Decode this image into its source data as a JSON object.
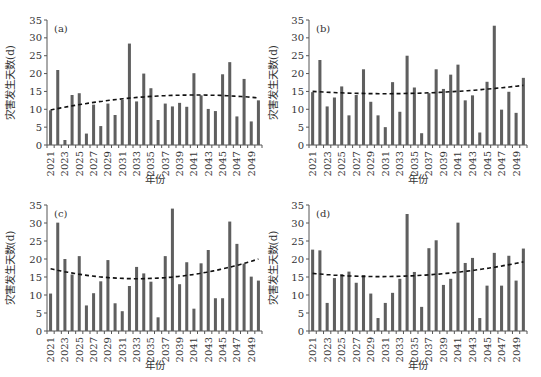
{
  "chart_data": [
    {
      "type": "bar",
      "panel_label": "(a)",
      "xlabel": "年份",
      "ylabel": "灾害发生天数(d)",
      "ylim": [
        0,
        35
      ],
      "yticks": [
        0,
        5,
        10,
        15,
        20,
        25,
        30,
        35
      ],
      "xtick_labels": [
        "2021",
        "2023",
        "2025",
        "2027",
        "2029",
        "2031",
        "2033",
        "2035",
        "2037",
        "2039",
        "2041",
        "2043",
        "2045",
        "2047",
        "2049"
      ],
      "categories": [
        2021,
        2022,
        2023,
        2024,
        2025,
        2026,
        2027,
        2028,
        2029,
        2030,
        2031,
        2032,
        2033,
        2034,
        2035,
        2036,
        2037,
        2038,
        2039,
        2040,
        2041,
        2042,
        2043,
        2044,
        2045,
        2046,
        2047,
        2048,
        2049,
        2050
      ],
      "values": [
        9.7,
        21,
        1.4,
        14,
        14.5,
        3.2,
        11.3,
        5.3,
        11.6,
        8.4,
        12.6,
        28.4,
        12.2,
        20,
        15.9,
        7,
        11.6,
        10.8,
        11.8,
        10.7,
        20.1,
        13.9,
        10.1,
        9.5,
        19.8,
        23.2,
        8,
        18.5,
        6.6,
        12.5
      ],
      "trend": {
        "type": "polynomial",
        "style": "dashed",
        "start": 9.8,
        "extreme": 14.0,
        "extreme_year": 2041,
        "end": 13.2
      },
      "grid": false
    },
    {
      "type": "bar",
      "panel_label": "(b)",
      "xlabel": "年份",
      "ylabel": "灾害发生天数(d)",
      "ylim": [
        0,
        35
      ],
      "yticks": [
        0,
        5,
        10,
        15,
        20,
        25,
        30,
        35
      ],
      "xtick_labels": [
        "2021",
        "2023",
        "2025",
        "2027",
        "2029",
        "2031",
        "2033",
        "2035",
        "2037",
        "2039",
        "2041",
        "2043",
        "2045",
        "2047",
        "2049"
      ],
      "categories": [
        2021,
        2022,
        2023,
        2024,
        2025,
        2026,
        2027,
        2028,
        2029,
        2030,
        2031,
        2032,
        2033,
        2034,
        2035,
        2036,
        2037,
        2038,
        2039,
        2040,
        2041,
        2042,
        2043,
        2044,
        2045,
        2046,
        2047,
        2048,
        2049,
        2050
      ],
      "values": [
        14.8,
        23.8,
        10.8,
        13.3,
        16.4,
        8.3,
        14,
        21.2,
        12.1,
        8.3,
        5,
        17.6,
        9.3,
        25,
        16.1,
        3.3,
        14.5,
        21.2,
        15.7,
        19.7,
        22.5,
        12.5,
        13.9,
        3.5,
        17.7,
        33.4,
        9.9,
        14.9,
        9,
        18.8
      ],
      "trend": {
        "type": "polynomial",
        "style": "dashed",
        "start": 15.0,
        "extreme": 14.4,
        "extreme_year": 2033,
        "end": 16.7
      },
      "grid": false
    },
    {
      "type": "bar",
      "panel_label": "(c)",
      "xlabel": "年份",
      "ylabel": "灾害发生天数(d)",
      "ylim": [
        0,
        35
      ],
      "yticks": [
        0,
        5,
        10,
        15,
        20,
        25,
        30,
        35
      ],
      "xtick_labels": [
        "2021",
        "2023",
        "2025",
        "2027",
        "2029",
        "2031",
        "2033",
        "2035",
        "2037",
        "2039",
        "2041",
        "2043",
        "2045",
        "2047",
        "2049"
      ],
      "categories": [
        2021,
        2022,
        2023,
        2024,
        2025,
        2026,
        2027,
        2028,
        2029,
        2030,
        2031,
        2032,
        2033,
        2034,
        2035,
        2036,
        2037,
        2038,
        2039,
        2040,
        2041,
        2042,
        2043,
        2044,
        2045,
        2046,
        2047,
        2048,
        2049,
        2050
      ],
      "values": [
        10.4,
        30.1,
        20,
        15.7,
        20.8,
        7.1,
        10.5,
        13.8,
        19.7,
        7.7,
        5.5,
        12.5,
        17.8,
        16,
        13.7,
        3.8,
        20.8,
        34,
        13,
        19.1,
        6.2,
        18.8,
        22.5,
        9.1,
        9.1,
        30.4,
        24.2,
        18.7,
        15.1,
        14
      ],
      "trend": {
        "type": "polynomial",
        "style": "dashed",
        "start": 17.3,
        "extreme": 14.6,
        "extreme_year": 2035,
        "end": 20.0
      },
      "grid": false
    },
    {
      "type": "bar",
      "panel_label": "(d)",
      "xlabel": "年份",
      "ylabel": "灾害发生天数(d)",
      "ylim": [
        0,
        35
      ],
      "yticks": [
        0,
        5,
        10,
        15,
        20,
        25,
        30,
        35
      ],
      "xtick_labels": [
        "2021",
        "2023",
        "2025",
        "2027",
        "2029",
        "2031",
        "2033",
        "2035",
        "2037",
        "2039",
        "2041",
        "2043",
        "2045",
        "2047",
        "2049"
      ],
      "categories": [
        2021,
        2022,
        2023,
        2024,
        2025,
        2026,
        2027,
        2028,
        2029,
        2030,
        2031,
        2032,
        2033,
        2034,
        2035,
        2036,
        2037,
        2038,
        2039,
        2040,
        2041,
        2042,
        2043,
        2044,
        2045,
        2046,
        2047,
        2048,
        2049,
        2050
      ],
      "values": [
        22.6,
        22.4,
        7.8,
        14.7,
        15.8,
        16.5,
        13.4,
        15.5,
        10.4,
        3.6,
        7.8,
        10.6,
        14.5,
        32.5,
        16.4,
        6.7,
        23,
        25.2,
        12.8,
        14.5,
        30.1,
        18.9,
        20.3,
        3.6,
        12.6,
        21.7,
        12.6,
        20.9,
        14,
        22.9
      ],
      "trend": {
        "type": "polynomial",
        "style": "dashed",
        "start": 16.0,
        "extreme": 15.2,
        "extreme_year": 2033,
        "end": 19.2
      },
      "grid": false
    }
  ],
  "colors": {
    "bar": "#5f5f5f",
    "axis": "#555555",
    "trend": "#111111",
    "text": "#333333"
  }
}
